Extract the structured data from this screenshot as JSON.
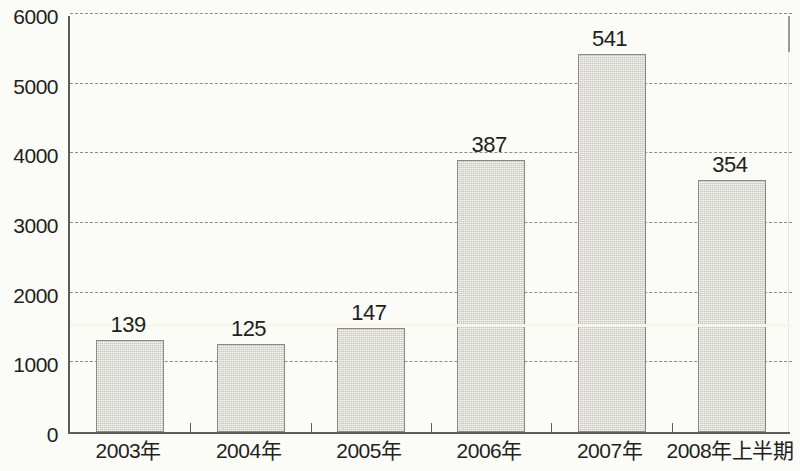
{
  "chart_data": {
    "type": "bar",
    "title": "",
    "subtitle": "",
    "xlabel": "",
    "ylabel": "",
    "categories": [
      "2003年",
      "2004年",
      "2005年",
      "2006年",
      "2007年",
      "2008年上半期"
    ],
    "values": [
      1320,
      1270,
      1500,
      3900,
      5430,
      3620
    ],
    "data_labels": [
      "139",
      "125",
      "147",
      "387",
      "541",
      "354"
    ],
    "ylim": [
      0,
      6000
    ],
    "ytick_labels": [
      "0",
      "1000",
      "2000",
      "3000",
      "4000",
      "5000",
      "6000"
    ],
    "ytick_values": [
      0,
      1000,
      2000,
      3000,
      4000,
      5000,
      6000
    ],
    "grid": true,
    "grid_style": "dashed",
    "legend": false,
    "legend_position": "none",
    "series": [
      {
        "name": "",
        "values": [
          1320,
          1270,
          1500,
          3900,
          5430,
          3620
        ],
        "labels": [
          "139",
          "125",
          "147",
          "387",
          "541",
          "354"
        ]
      }
    ]
  },
  "colors": {
    "bar_fill": "#dcdcd4",
    "bar_border": "#8a8a82",
    "axis": "#5d5d58",
    "grid": "#8d8d86",
    "text": "#231f1c",
    "background": "#fbfbf8"
  }
}
